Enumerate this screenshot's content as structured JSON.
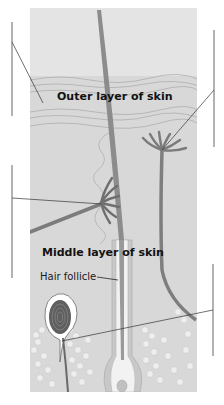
{
  "diagram": {
    "type": "anatomy-cross-section",
    "labels": {
      "outer_layer": "Outer layer of skin",
      "middle_layer": "Middle layer of skin",
      "hair_follicle": "Hair follicle"
    },
    "blank_label_lines": [
      {
        "side": "left",
        "position": "top",
        "points_to": "outer layer surface"
      },
      {
        "side": "left",
        "position": "middle",
        "points_to": "oil gland at hair follicle"
      },
      {
        "side": "right",
        "position": "top",
        "points_to": "sweat gland / nerve ending below outer layer"
      },
      {
        "side": "right",
        "position": "bottom",
        "points_to": "pressure receptor (layered capsule)"
      }
    ],
    "colors": {
      "background": "#ffffff",
      "tissue": "#d9d9d9",
      "outer_layer": "#e2e2e2",
      "structure_dark": "#6e6e6e",
      "structure_mid": "#8f8f8f",
      "fat_cells": "#ececec",
      "leader_line": "#333333"
    }
  }
}
